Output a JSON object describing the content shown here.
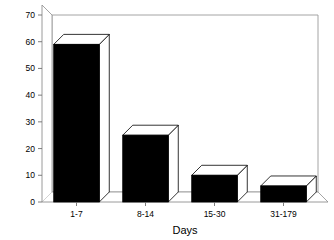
{
  "chart_data": {
    "type": "bar",
    "title": "",
    "subtitle": "",
    "xlabel": "Days",
    "ylabel": "",
    "categories": [
      "1-7",
      "8-14",
      "15-30",
      "31-179"
    ],
    "values": [
      59,
      25,
      10,
      6
    ],
    "series": [
      {
        "name": "count",
        "values": [
          59,
          25,
          10,
          6
        ]
      }
    ],
    "ylim": [
      0,
      70
    ],
    "yticks": [
      0,
      10,
      20,
      30,
      40,
      50,
      60,
      70
    ],
    "ytick_labels": [
      "0",
      "10",
      "20",
      "30",
      "40",
      "50",
      "60",
      "70"
    ],
    "xtick_labels": [
      "1-7",
      "8-14",
      "15-30",
      "31-179"
    ],
    "grid": false,
    "legend": false,
    "legend_position": "none",
    "style": "3d-bar",
    "bar_color": "#000000",
    "bar_face_color": "#ffffff",
    "frame_color": "#9a9a9a",
    "background": "#ffffff"
  },
  "axis": {
    "y_tick_labels": [
      "70",
      "60",
      "50",
      "40",
      "30",
      "20",
      "10",
      "0"
    ],
    "x_title": "Days"
  }
}
